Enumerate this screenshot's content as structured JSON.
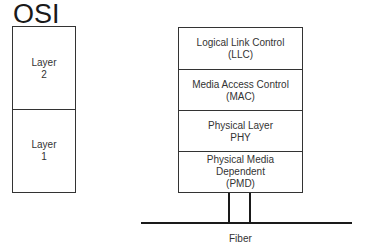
{
  "title": "OSI",
  "osi_layers": [
    {
      "label": "Layer\n2"
    },
    {
      "label": "Layer\n1"
    }
  ],
  "stack_layers": [
    {
      "label": "Logical Link Control\n(LLC)"
    },
    {
      "label": "Media Access Control\n(MAC)"
    },
    {
      "label": "Physical Layer\nPHY"
    },
    {
      "label": "Physical Media\nDependent\n(PMD)"
    }
  ],
  "medium": {
    "label": "Fiber"
  }
}
